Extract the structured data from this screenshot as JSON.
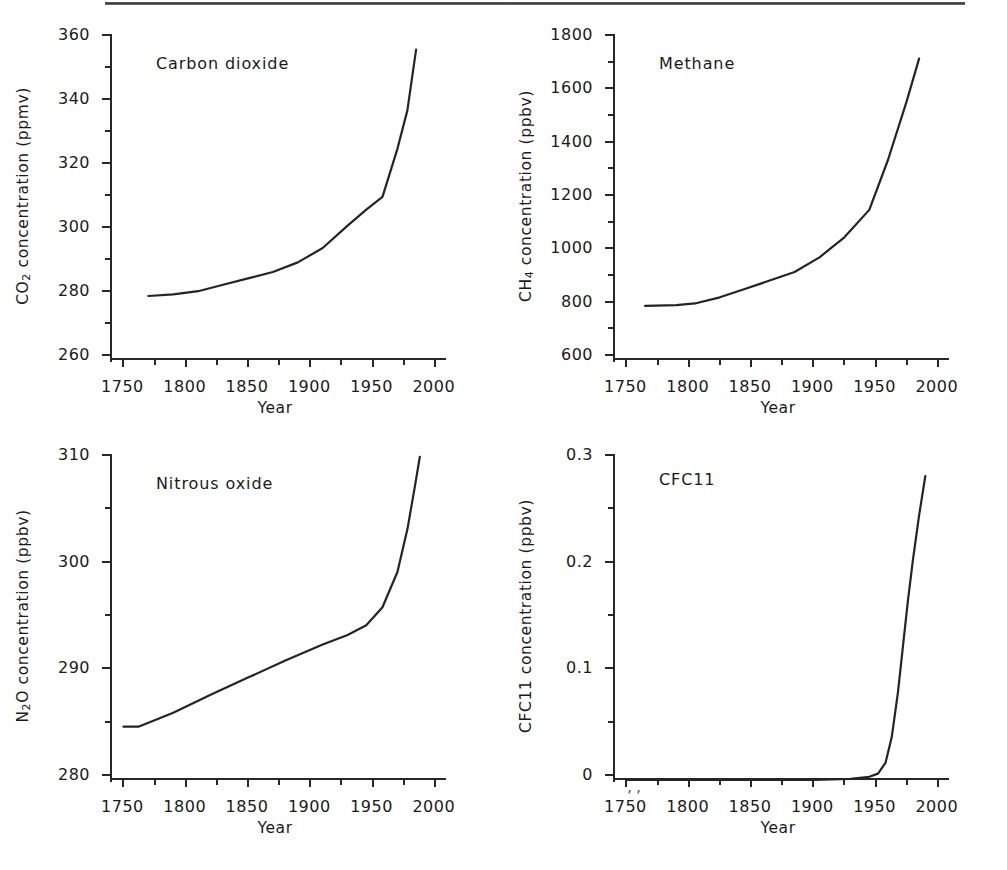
{
  "figure": {
    "shared_xlabel": "Year",
    "panel_count": 4
  },
  "page": {
    "bleed_text_line1": " ",
    "bleed_text_line2": " "
  },
  "chart_data": [
    {
      "type": "line",
      "title": "Carbon dioxide",
      "xlabel": "Year",
      "ylabel": "CO2 concentration (ppmv)",
      "ylabel_base": "CO",
      "ylabel_sub": "2",
      "ylabel_rest": " concentration (ppmv)",
      "xlim": [
        1740,
        2005
      ],
      "ylim": [
        260,
        360
      ],
      "xticks": [
        1750,
        1800,
        1850,
        1900,
        1950,
        2000
      ],
      "xticklabels": [
        "1750",
        "1800",
        "1850",
        "1900",
        "1950",
        "2000"
      ],
      "xminor_step": 25,
      "yticks": [
        260,
        280,
        300,
        320,
        340,
        360
      ],
      "yticklabels": [
        "260",
        "280",
        "300",
        "320",
        "340",
        "360"
      ],
      "yminor_step": 10,
      "grid": false,
      "legend": "none",
      "x": [
        1770,
        1790,
        1810,
        1830,
        1850,
        1870,
        1890,
        1910,
        1930,
        1945,
        1958,
        1970,
        1978,
        1985
      ],
      "y": [
        280,
        280.5,
        281.5,
        283.5,
        285.5,
        287.5,
        290.5,
        295,
        302,
        307,
        311,
        326,
        338,
        357
      ]
    },
    {
      "type": "line",
      "title": "Methane",
      "xlabel": "Year",
      "ylabel": "CH4 concentration (ppbv)",
      "ylabel_base": "CH",
      "ylabel_sub": "4",
      "ylabel_rest": " concentration (ppbv)",
      "xlim": [
        1740,
        2005
      ],
      "ylim": [
        600,
        1800
      ],
      "xticks": [
        1750,
        1800,
        1850,
        1900,
        1950,
        2000
      ],
      "xticklabels": [
        "1750",
        "1800",
        "1850",
        "1900",
        "1950",
        "2000"
      ],
      "xminor_step": 25,
      "yticks": [
        600,
        800,
        1000,
        1200,
        1400,
        1600,
        1800
      ],
      "yticklabels": [
        "600",
        "800",
        "1000",
        "1200",
        "1400",
        "1600",
        "1800"
      ],
      "yminor_step": 100,
      "grid": false,
      "legend": "none",
      "x": [
        1765,
        1790,
        1805,
        1825,
        1845,
        1865,
        1885,
        1905,
        1925,
        1945,
        1960,
        1975,
        1985
      ],
      "y": [
        803,
        806,
        812,
        835,
        866,
        898,
        930,
        985,
        1060,
        1163,
        1350,
        1570,
        1730
      ]
    },
    {
      "type": "line",
      "title": "Nitrous oxide",
      "xlabel": "Year",
      "ylabel": "N2O concentration (ppbv)",
      "ylabel_base": "N",
      "ylabel_sub": "2",
      "ylabel_rest": "O concentration (ppbv)",
      "xlim": [
        1740,
        2005
      ],
      "ylim": [
        280,
        310
      ],
      "xticks": [
        1750,
        1800,
        1850,
        1900,
        1950,
        2000
      ],
      "xticklabels": [
        "1750",
        "1800",
        "1850",
        "1900",
        "1950",
        "2000"
      ],
      "xminor_step": 25,
      "yticks": [
        280,
        290,
        300,
        310
      ],
      "yticklabels": [
        "280",
        "290",
        "300",
        "310"
      ],
      "yminor_step": 5,
      "grid": false,
      "legend": "none",
      "x": [
        1750,
        1762,
        1790,
        1820,
        1850,
        1880,
        1910,
        1930,
        1945,
        1958,
        1970,
        1978,
        1984,
        1988
      ],
      "y": [
        285,
        285,
        286.3,
        288,
        289.6,
        291.2,
        292.7,
        293.6,
        294.5,
        296.2,
        299.5,
        303.5,
        307.5,
        310.3
      ]
    },
    {
      "type": "line",
      "title": "CFC11",
      "xlabel": "Year",
      "ylabel": "CFC11 concentration (ppbv)",
      "ylabel_base": "CFC11",
      "ylabel_sub": "",
      "ylabel_rest": " concentration (ppbv)",
      "xlim": [
        1740,
        2005
      ],
      "ylim": [
        0,
        0.3
      ],
      "xticks": [
        1750,
        1800,
        1850,
        1900,
        1950,
        2000
      ],
      "xticklabels": [
        "1750",
        "1800",
        "1850",
        "1900",
        "1950",
        "2000"
      ],
      "xminor_step": 25,
      "yticks": [
        0,
        0.1,
        0.2,
        0.3
      ],
      "yticklabels": [
        "0",
        "0.1",
        "0.2",
        "0.3"
      ],
      "yminor_step": 0.05,
      "grid": false,
      "legend": "none",
      "x": [
        1750,
        1850,
        1900,
        1930,
        1945,
        1952,
        1958,
        1963,
        1968,
        1972,
        1976,
        1980,
        1985,
        1990
      ],
      "y": [
        0,
        0,
        0,
        0.001,
        0.003,
        0.006,
        0.016,
        0.04,
        0.082,
        0.125,
        0.168,
        0.206,
        0.248,
        0.285
      ]
    }
  ]
}
